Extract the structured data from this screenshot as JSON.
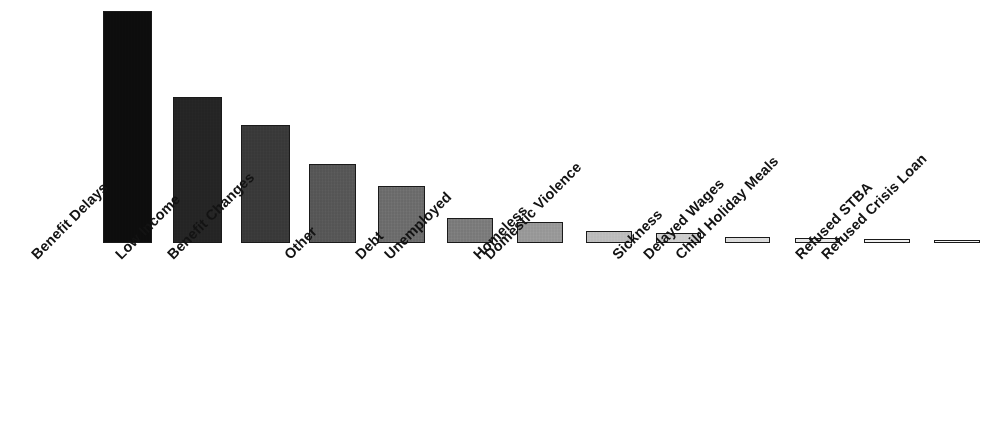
{
  "chart_data": {
    "type": "bar",
    "title": "",
    "subtitle": "",
    "xlabel": "",
    "ylabel": "",
    "grid": false,
    "legend": false,
    "legend_position": "none",
    "axis_visible": false,
    "ylim": [
      0,
      240
    ],
    "categories": [
      "Benefit Delays",
      "Low Income",
      "Benefit Changes",
      "Other",
      "Debt",
      "Unemployed",
      "Homeless",
      "Domestic Violence",
      "Sickness",
      "Delayed Wages",
      "Child Holiday Meals",
      "Refused STBA",
      "Refused Crisis Loan"
    ],
    "values": [
      236,
      148,
      120,
      80,
      58,
      25,
      21,
      12,
      10,
      6,
      5,
      4,
      3
    ],
    "bar_colors": [
      "#0d0d0d",
      "#252525",
      "#3a3a3a",
      "#585858",
      "#6e6e6e",
      "#7d7d7d",
      "#9a9a9a",
      "#bdbdbd",
      "#cecece",
      "#dcdcdc",
      "#e8e8e8",
      "#f0f0f0",
      "#f5f5f5"
    ],
    "bar_border_color": "#1a1a1a",
    "background_color": "#ffffff",
    "tick_label_rotation_deg": -45,
    "bars": [
      {
        "label": "Benefit Delays",
        "value": 236,
        "x": 103,
        "width": 49,
        "color": "#0d0d0d"
      },
      {
        "label": "Low Income",
        "value": 148,
        "x": 173,
        "width": 49,
        "color": "#252525"
      },
      {
        "label": "Benefit Changes",
        "value": 120,
        "x": 241,
        "width": 49,
        "color": "#3a3a3a"
      },
      {
        "label": "Other",
        "value": 80,
        "x": 309,
        "width": 47,
        "color": "#585858"
      },
      {
        "label": "Debt",
        "value": 58,
        "x": 378,
        "width": 47,
        "color": "#6e6e6e"
      },
      {
        "label": "Unemployed",
        "value": 25,
        "x": 447,
        "width": 46,
        "color": "#7d7d7d"
      },
      {
        "label": "Homeless",
        "value": 21,
        "x": 517,
        "width": 46,
        "color": "#9a9a9a"
      },
      {
        "label": "Domestic Violence",
        "value": 12,
        "x": 586,
        "width": 46,
        "color": "#bdbdbd"
      },
      {
        "label": "Sickness",
        "value": 10,
        "x": 656,
        "width": 45,
        "color": "#cecece"
      },
      {
        "label": "Delayed Wages",
        "value": 6,
        "x": 725,
        "width": 45,
        "color": "#dcdcdc"
      },
      {
        "label": "Child Holiday Meals",
        "value": 5,
        "x": 795,
        "width": 45,
        "color": "#e8e8e8"
      },
      {
        "label": "Refused STBA",
        "value": 4,
        "x": 864,
        "width": 46,
        "color": "#f0f0f0"
      },
      {
        "label": "Refused Crisis Loan",
        "value": 3,
        "x": 934,
        "width": 46,
        "color": "#f5f5f5"
      }
    ],
    "tick_label_anchors": [
      {
        "label": "Benefit Delays",
        "x": 28,
        "y": 8
      },
      {
        "label": "Low Income",
        "x": 112,
        "y": 8
      },
      {
        "label": "Benefit Changes",
        "x": 164,
        "y": 8
      },
      {
        "label": "Other",
        "x": 281,
        "y": 8
      },
      {
        "label": "Debt",
        "x": 352,
        "y": 8
      },
      {
        "label": "Unemployed",
        "x": 381,
        "y": 8
      },
      {
        "label": "Homeless",
        "x": 470,
        "y": 8
      },
      {
        "label": "Domestic Violence",
        "x": 481,
        "y": 8
      },
      {
        "label": "Sickness",
        "x": 609,
        "y": 8
      },
      {
        "label": "Delayed Wages",
        "x": 640,
        "y": 8
      },
      {
        "label": "Child Holiday Meals",
        "x": 672,
        "y": 8
      },
      {
        "label": "Refused STBA",
        "x": 792,
        "y": 8
      },
      {
        "label": "Refused Crisis Loan",
        "x": 818,
        "y": 8
      }
    ]
  }
}
